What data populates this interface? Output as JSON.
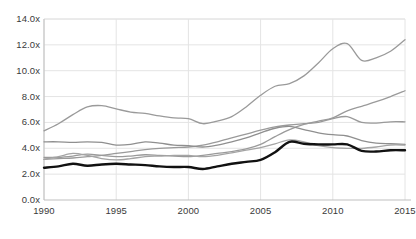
{
  "chart_data": {
    "type": "line",
    "title": "",
    "xlabel": "",
    "ylabel": "",
    "xlim": [
      1990,
      2015
    ],
    "ylim": [
      0.0,
      14.0
    ],
    "grid": true,
    "legend": "none",
    "y_tick_labels": [
      "14.0x",
      "12.0x",
      "10.0x",
      "8.0x",
      "6.0x",
      "4.0x",
      "2.0x",
      "0.0x"
    ],
    "y_tick_values": [
      14.0,
      12.0,
      10.0,
      8.0,
      6.0,
      4.0,
      2.0,
      0.0
    ],
    "x_tick_labels": [
      "1990",
      "1995",
      "2000",
      "2005",
      "2010",
      "2015"
    ],
    "x_tick_values": [
      1990,
      1995,
      2000,
      2005,
      2010,
      2015
    ],
    "x": [
      1990,
      1991,
      1992,
      1993,
      1994,
      1995,
      1996,
      1997,
      1998,
      1999,
      2000,
      2001,
      2002,
      2003,
      2004,
      2005,
      2006,
      2007,
      2008,
      2009,
      2010,
      2011,
      2012,
      2013,
      2014,
      2015
    ],
    "series": [
      {
        "name": "series-1",
        "color": "#9a9a9a",
        "width": 1.3,
        "emphasis": false,
        "values": [
          5.35,
          5.9,
          6.6,
          7.2,
          7.3,
          7.05,
          6.8,
          6.7,
          6.5,
          6.35,
          6.3,
          5.9,
          6.1,
          6.45,
          7.2,
          8.1,
          8.8,
          9.0,
          9.6,
          10.6,
          11.7,
          12.1,
          10.8,
          11.0,
          11.5,
          12.4
        ]
      },
      {
        "name": "series-2",
        "color": "#9a9a9a",
        "width": 1.3,
        "emphasis": false,
        "values": [
          3.15,
          3.2,
          3.25,
          3.35,
          3.45,
          3.6,
          3.75,
          3.9,
          4.0,
          4.05,
          4.1,
          4.25,
          4.5,
          4.8,
          5.1,
          5.4,
          5.65,
          5.8,
          5.9,
          6.0,
          6.3,
          6.45,
          6.0,
          5.95,
          6.05,
          6.05
        ]
      },
      {
        "name": "series-3",
        "color": "#9a9a9a",
        "width": 1.3,
        "emphasis": false,
        "values": [
          3.3,
          3.3,
          3.4,
          3.55,
          3.45,
          3.35,
          3.4,
          3.5,
          3.45,
          3.4,
          3.35,
          3.45,
          3.6,
          3.75,
          3.95,
          4.3,
          4.9,
          5.45,
          5.85,
          6.1,
          6.35,
          6.9,
          7.25,
          7.6,
          8.0,
          8.45
        ]
      },
      {
        "name": "series-4",
        "color": "#8f8f8f",
        "width": 1.3,
        "emphasis": false,
        "values": [
          4.5,
          4.5,
          4.45,
          4.5,
          4.45,
          4.25,
          4.3,
          4.5,
          4.4,
          4.25,
          4.2,
          4.1,
          4.25,
          4.5,
          4.8,
          5.2,
          5.55,
          5.7,
          5.45,
          5.2,
          5.05,
          4.95,
          4.6,
          4.4,
          4.35,
          4.3
        ]
      },
      {
        "name": "series-5",
        "color": "#a4a4a4",
        "width": 1.3,
        "emphasis": false,
        "values": [
          3.15,
          3.35,
          3.6,
          3.45,
          3.2,
          3.1,
          3.2,
          3.35,
          3.4,
          3.45,
          3.45,
          3.35,
          3.45,
          3.65,
          3.85,
          4.05,
          4.35,
          4.65,
          4.5,
          4.2,
          4.05,
          4.0,
          4.0,
          4.1,
          4.25,
          4.25
        ]
      },
      {
        "name": "series-6-highlight",
        "color": "#111111",
        "width": 2.4,
        "emphasis": true,
        "values": [
          2.5,
          2.6,
          2.8,
          2.65,
          2.75,
          2.8,
          2.75,
          2.7,
          2.6,
          2.55,
          2.55,
          2.4,
          2.6,
          2.8,
          2.95,
          3.1,
          3.7,
          4.5,
          4.35,
          4.3,
          4.3,
          4.3,
          3.8,
          3.75,
          3.85,
          3.85
        ]
      }
    ]
  },
  "axes": {
    "axis_line_color": "#bfbfbf",
    "grid_color": "#e4e4e4",
    "tick_text_color": "#3a3a3a"
  }
}
